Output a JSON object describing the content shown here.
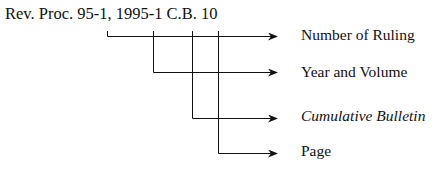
{
  "citation": "Rev. Proc. 95-1, 1995-1 C.B. 10",
  "labels": [
    {
      "text": "Number of Ruling",
      "italic": false
    },
    {
      "text": "Year and Volume",
      "italic": false
    },
    {
      "text": "Cumulative Bulletin",
      "italic": true
    },
    {
      "text": "Page",
      "italic": false
    }
  ]
}
